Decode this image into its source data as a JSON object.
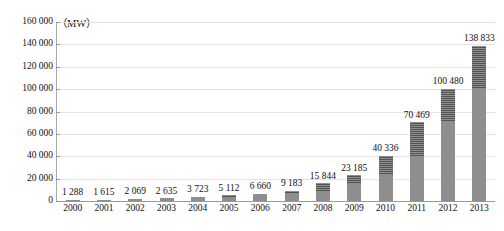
{
  "chart_data": {
    "type": "bar",
    "title": "",
    "subtitle": "",
    "unit_label": "（MW）",
    "xlabel": "",
    "ylabel": "",
    "categories": [
      "2000",
      "2001",
      "2002",
      "2003",
      "2004",
      "2005",
      "2006",
      "2007",
      "2008",
      "2009",
      "2010",
      "2011",
      "2012",
      "2013"
    ],
    "values": [
      1288,
      1615,
      2069,
      2635,
      3723,
      5112,
      6660,
      9183,
      15844,
      23185,
      40336,
      70469,
      100480,
      138833
    ],
    "value_labels": [
      "1 288",
      "1 615",
      "2 069",
      "2 635",
      "3 723",
      "5 112",
      "6 660",
      "9 183",
      "15 844",
      "23 185",
      "40 336",
      "70 469",
      "100 480",
      "138 833"
    ],
    "stacked": true,
    "series": [
      {
        "name": "cumulative-base",
        "values": [
          1288,
          1288,
          1615,
          2069,
          2635,
          3723,
          5112,
          6660,
          9183,
          15844,
          23185,
          40336,
          70469,
          100480
        ]
      },
      {
        "name": "annual-addition",
        "values": [
          0,
          327,
          454,
          566,
          1088,
          1389,
          1548,
          2523,
          6661,
          7341,
          17151,
          30133,
          30011,
          38353
        ]
      }
    ],
    "ylim": [
      0,
      160000
    ],
    "ytick_step": 20000,
    "ytick_labels": [
      "0",
      "20 000",
      "40 000",
      "60 000",
      "80 000",
      "100 000",
      "120 000",
      "140 000",
      "160 000"
    ],
    "ytick_values": [
      0,
      20000,
      40000,
      60000,
      80000,
      100000,
      120000,
      140000,
      160000
    ],
    "grid": true,
    "grid_orientation": "horizontal",
    "legend": [],
    "legend_position": "none",
    "colors": {
      "bar_base": "#8e8e8e",
      "bar_top": "#5e5e5e",
      "gridline": "#e3e3e3",
      "axis": "#9a9a9a",
      "text": "#111111",
      "background": "#ffffff"
    }
  }
}
